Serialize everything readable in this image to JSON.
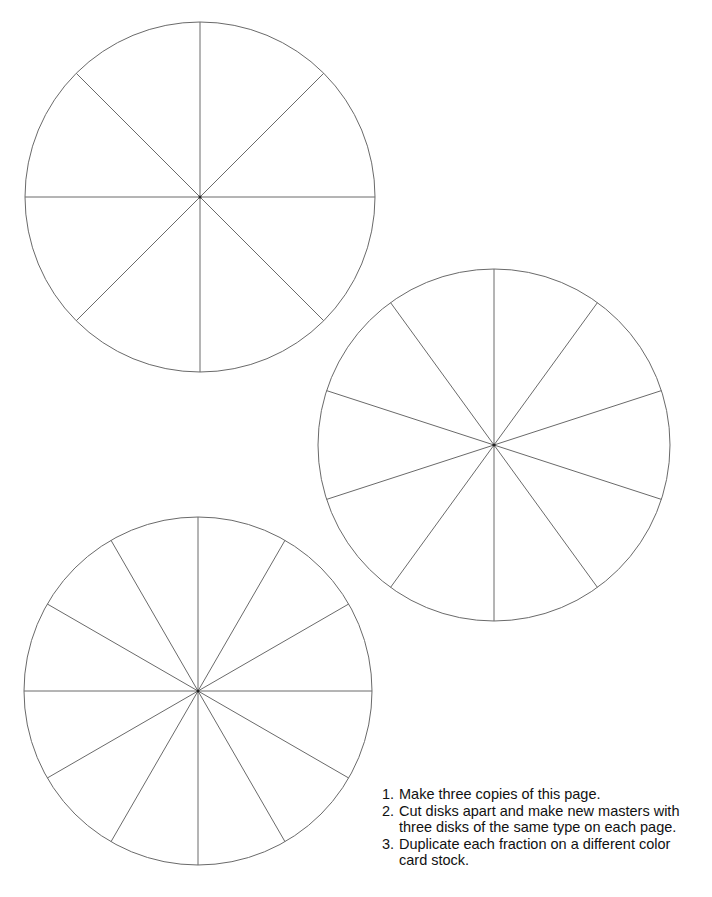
{
  "disks": [
    {
      "name": "eighths-disk",
      "cx": 200,
      "cy": 197,
      "r": 175,
      "sections": 8,
      "start_angle_deg": 90
    },
    {
      "name": "tenths-disk",
      "cx": 494,
      "cy": 445,
      "r": 176,
      "sections": 10,
      "start_angle_deg": 90
    },
    {
      "name": "twelfths-disk",
      "cx": 198,
      "cy": 691,
      "r": 174,
      "sections": 12,
      "start_angle_deg": 90
    }
  ],
  "style": {
    "line_color": "#6a6a6a",
    "background": "#ffffff",
    "text_color": "#111111"
  },
  "instructions": [
    {
      "number": "1.",
      "text": "Make three copies of this page."
    },
    {
      "number": "2.",
      "text": "Cut disks apart and make new masters with three disks of the same type on each page."
    },
    {
      "number": "3.",
      "text": "Duplicate each fraction on a different color card stock."
    }
  ]
}
